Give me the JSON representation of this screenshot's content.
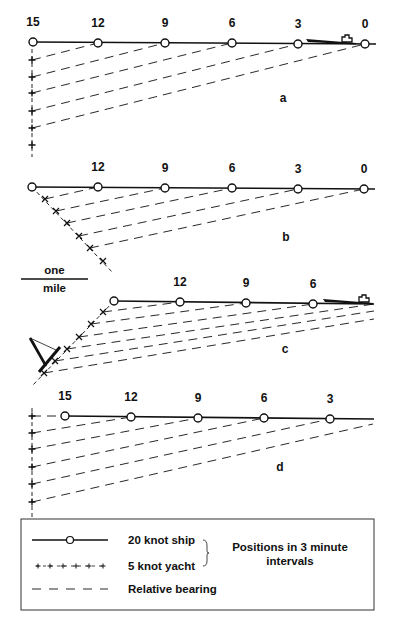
{
  "figure": {
    "ink_color": "#111111",
    "background": "#ffffff",
    "panels": [
      {
        "id": "a",
        "label": "a",
        "label_pos": [
          283,
          102
        ],
        "ship_labels": [
          "15",
          "12",
          "9",
          "6",
          "3",
          "0"
        ],
        "ship_positions": [
          [
            33,
            42
          ],
          [
            98,
            43
          ],
          [
            165,
            43
          ],
          [
            232,
            43
          ],
          [
            298,
            44
          ],
          [
            365,
            44
          ]
        ],
        "ship_line_end": [
          376,
          44
        ],
        "label_offset_y": -16,
        "yacht_positions": [
          [
            32,
            60
          ],
          [
            32,
            77
          ],
          [
            32,
            93
          ],
          [
            32,
            111
          ],
          [
            32,
            128
          ],
          [
            32,
            145
          ]
        ],
        "yacht_track": [
          [
            32,
            42
          ],
          [
            32,
            157
          ]
        ],
        "yacht_mark": "plus",
        "bearings": [
          [
            1,
            0
          ],
          [
            2,
            1
          ],
          [
            3,
            2
          ],
          [
            4,
            3
          ],
          [
            5,
            4
          ]
        ],
        "ship_icon": {
          "at": [
            306,
            44
          ],
          "length": 50
        }
      },
      {
        "id": "b",
        "label": "b",
        "label_pos": [
          286,
          241
        ],
        "ship_labels": [
          "",
          "12",
          "9",
          "6",
          "3",
          "0"
        ],
        "ship_positions": [
          [
            32,
            187
          ],
          [
            98,
            187
          ],
          [
            165,
            188
          ],
          [
            232,
            188
          ],
          [
            298,
            189
          ],
          [
            364,
            189
          ]
        ],
        "ship_line_end": [
          375,
          189
        ],
        "label_offset_y": -16,
        "yacht_positions": [
          [
            45,
            199
          ],
          [
            56,
            211
          ],
          [
            67,
            223
          ],
          [
            79,
            236
          ],
          [
            90,
            248
          ],
          [
            103,
            261
          ]
        ],
        "yacht_track": [
          [
            32,
            187
          ],
          [
            113,
            273
          ]
        ],
        "yacht_mark": "cross",
        "bearings": [
          [
            1,
            0
          ],
          [
            2,
            1
          ],
          [
            3,
            2
          ],
          [
            4,
            3
          ],
          [
            5,
            4
          ]
        ]
      },
      {
        "id": "c",
        "label": "c",
        "label_pos": [
          285,
          353
        ],
        "ship_labels": [
          "",
          "12",
          "9",
          "6"
        ],
        "ship_positions": [
          [
            114,
            301
          ],
          [
            180,
            302
          ],
          [
            246,
            303
          ],
          [
            313,
            304
          ]
        ],
        "ship_line_end": [
          374,
          304
        ],
        "label_offset_y": -16,
        "yacht_positions": [
          [
            103,
            312
          ],
          [
            91,
            324
          ],
          [
            79,
            337
          ],
          [
            67,
            349
          ],
          [
            55,
            361
          ],
          [
            44,
            373
          ]
        ],
        "yacht_track": [
          [
            114,
            301
          ],
          [
            33,
            385
          ]
        ],
        "yacht_mark": "cross",
        "bearing_targets": [
          [
            180,
            302
          ],
          [
            246,
            303
          ],
          [
            313,
            304
          ],
          [
            374,
            304
          ],
          [
            374,
            311
          ],
          [
            374,
            319
          ]
        ],
        "extra_bearings": [
          [
            [
              150,
              316
            ],
            [
              374,
              304
            ]
          ]
        ],
        "ship_icon": {
          "at": [
            323,
            304
          ],
          "length": 50
        },
        "yacht_icon": {
          "mast_top": [
            30,
            338
          ],
          "hull_bow": [
            60,
            347
          ],
          "hull_stern": [
            39,
            372
          ]
        }
      },
      {
        "id": "d",
        "label": "d",
        "label_pos": [
          280,
          471
        ],
        "ship_labels": [
          "15",
          "12",
          "9",
          "6",
          "3"
        ],
        "ship_positions": [
          [
            65,
            416
          ],
          [
            131,
            417
          ],
          [
            198,
            418
          ],
          [
            264,
            418
          ],
          [
            330,
            419
          ]
        ],
        "ship_line_end": [
          374,
          419
        ],
        "label_offset_y": -16,
        "yacht_positions": [
          [
            32,
            416
          ],
          [
            32,
            433
          ],
          [
            32,
            449
          ],
          [
            32,
            467
          ],
          [
            32,
            484
          ],
          [
            32,
            502
          ]
        ],
        "yacht_track": [
          [
            32,
            408
          ],
          [
            32,
            519
          ]
        ],
        "yacht_mark": "plus",
        "bearing_pairs": [
          [
            [
              32,
              416
            ],
            [
              65,
              416
            ]
          ],
          [
            [
              32,
              433
            ],
            [
              131,
              417
            ]
          ],
          [
            [
              32,
              449
            ],
            [
              198,
              418
            ]
          ],
          [
            [
              32,
              467
            ],
            [
              264,
              418
            ]
          ],
          [
            [
              32,
              484
            ],
            [
              330,
              419
            ]
          ],
          [
            [
              32,
              502
            ],
            [
              373,
              424
            ]
          ]
        ]
      }
    ],
    "scale_bar": {
      "top_text": "one",
      "bottom_text": "mile",
      "x1": 21,
      "x2": 88,
      "y": 279
    },
    "legend": {
      "box": {
        "x": 21,
        "y": 519,
        "w": 353,
        "h": 91
      },
      "items": [
        {
          "symbol": "ship-track",
          "label": "20 knot ship",
          "y": 540
        },
        {
          "symbol": "yacht-track",
          "label": "5 knot yacht",
          "y": 566
        },
        {
          "symbol": "bearing-line",
          "label": "Relative bearing",
          "y": 589
        }
      ],
      "note_line1": "Positions in 3 minute",
      "note_line2": "intervals"
    }
  }
}
